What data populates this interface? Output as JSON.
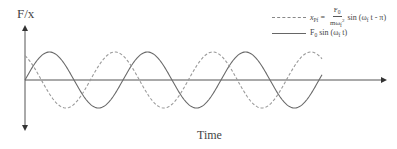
{
  "axes": {
    "y_label": "F/x",
    "x_label": "Time",
    "origin": [
      25,
      80
    ],
    "x_end": 385,
    "y_top": 28,
    "y_bottom": 128
  },
  "legend": {
    "dashed": {
      "lhs_var": "x",
      "lhs_sub": "Pf",
      "eq": "=",
      "num_var": "F",
      "num_sub": "0",
      "den_var": "mω",
      "den_sub": "f",
      "den_sup": "2",
      "fn": "sin (ω",
      "fn_sub": "f",
      "fn_tail": " t - π)"
    },
    "solid": {
      "var": "F",
      "var_sub": "0",
      "fn": " sin (ω",
      "fn_sub": "f",
      "fn_tail": " t)"
    }
  },
  "chart_data": {
    "type": "line",
    "title": "",
    "xlabel": "Time",
    "ylabel": "F/x",
    "series": [
      {
        "name": "F0 sin(ωf t)",
        "style": "solid",
        "color": "#666666",
        "phase": 0
      },
      {
        "name": "xPf = F0/(m ωf^2) sin(ωf t - π)",
        "style": "dashed",
        "color": "#999999",
        "phase": -3.14159
      }
    ],
    "periods_shown": 3,
    "amplitude_px": 28,
    "period_px": 98,
    "grid": false,
    "legend_position": "top-right"
  }
}
